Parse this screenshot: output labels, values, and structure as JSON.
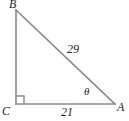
{
  "figure": {
    "kind": "geometry-diagram",
    "shape": "right-triangle",
    "background_color": "#ffffff",
    "stroke_color": "#8a8a8a",
    "label_color": "#262626",
    "width": 129,
    "height": 121
  },
  "vertices": [
    {
      "id": "B",
      "label": "B",
      "x": 16,
      "y": 10
    },
    {
      "id": "C",
      "label": "C",
      "x": 16,
      "y": 104
    },
    {
      "id": "A",
      "label": "A",
      "x": 115,
      "y": 104
    }
  ],
  "sides": [
    {
      "id": "hypotenuse",
      "from": "B",
      "to": "A",
      "label": "29"
    },
    {
      "id": "base",
      "from": "C",
      "to": "A",
      "label": "21"
    },
    {
      "id": "vertical-leg",
      "from": "B",
      "to": "C",
      "label": ""
    }
  ],
  "angles": [
    {
      "id": "angle-at-A",
      "at": "A",
      "label": "θ"
    },
    {
      "id": "angle-at-C",
      "at": "C",
      "label": "",
      "marker": "right-angle-square"
    }
  ],
  "markers": {
    "right_angle_square_size": 8
  }
}
